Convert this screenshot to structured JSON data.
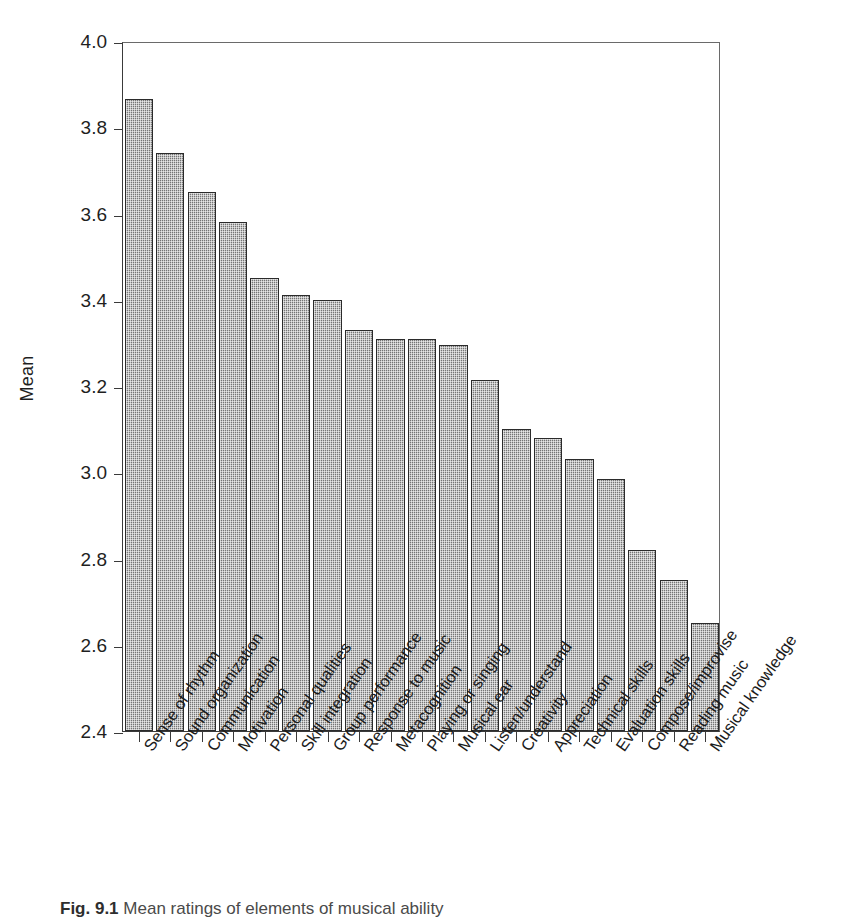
{
  "caption": {
    "figure_number": "Fig. 9.1",
    "text": "Mean ratings of elements of musical ability"
  },
  "chart_data": {
    "type": "bar",
    "title": "",
    "xlabel": "",
    "ylabel": "Mean",
    "ylim": [
      2.4,
      4.0
    ],
    "ytick_labels": [
      "2.4",
      "2.6",
      "2.8",
      "3.0",
      "3.2",
      "3.4",
      "3.6",
      "3.8",
      "4.0"
    ],
    "ytick_values": [
      2.4,
      2.6,
      2.8,
      3.0,
      3.2,
      3.4,
      3.6,
      3.8,
      4.0
    ],
    "grid": false,
    "legend": "none",
    "bar_color": "#8f8f8f",
    "bar_edge_color": "#2b2b2b",
    "categories": [
      "Sense of rhythm",
      "Sound organization",
      "Communication",
      "Motivation",
      "Personal qualities",
      "Skill integration",
      "Group performance",
      "Response to music",
      "Metacognition",
      "Playing or singing",
      "Musical ear",
      "Listen/understand",
      "Creativity",
      "Appreciation",
      "Technical skills",
      "Evaluation skills",
      "Compose/improvise",
      "Reading music",
      "Musical knowledge"
    ],
    "values": [
      3.865,
      3.74,
      3.65,
      3.58,
      3.45,
      3.41,
      3.4,
      3.33,
      3.31,
      3.31,
      3.295,
      3.215,
      3.1,
      3.08,
      3.03,
      2.985,
      2.82,
      2.75,
      2.65
    ]
  }
}
